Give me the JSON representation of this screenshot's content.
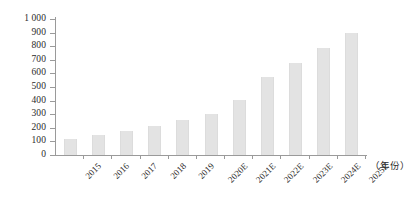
{
  "chart_data": {
    "type": "bar",
    "title": "",
    "subtitle": "",
    "xlabel": "（年份）",
    "ylabel": "",
    "categories": [
      "2015",
      "2016",
      "2017",
      "2018",
      "2019",
      "2020E",
      "2021E",
      "2022E",
      "2023E",
      "2024E",
      "2025E"
    ],
    "values": [
      120,
      145,
      180,
      215,
      255,
      305,
      405,
      570,
      680,
      790,
      900
    ],
    "ylim": [
      0,
      1000
    ],
    "ytick_step": 100,
    "ytick_labels": [
      "0",
      "100",
      "200",
      "300",
      "400",
      "500",
      "600",
      "700",
      "800",
      "900",
      "1 000"
    ],
    "grid": false,
    "legend": [],
    "legend_position": "none",
    "series": [
      {
        "name": "",
        "values": [
          120,
          145,
          180,
          215,
          255,
          305,
          405,
          570,
          680,
          790,
          900
        ]
      }
    ],
    "annotations": [],
    "colors": {
      "bar_fill": "#e3e3e3",
      "axis_line": "#9a9a9a",
      "text": "#2b2b2b",
      "background": "#ffffff"
    }
  }
}
